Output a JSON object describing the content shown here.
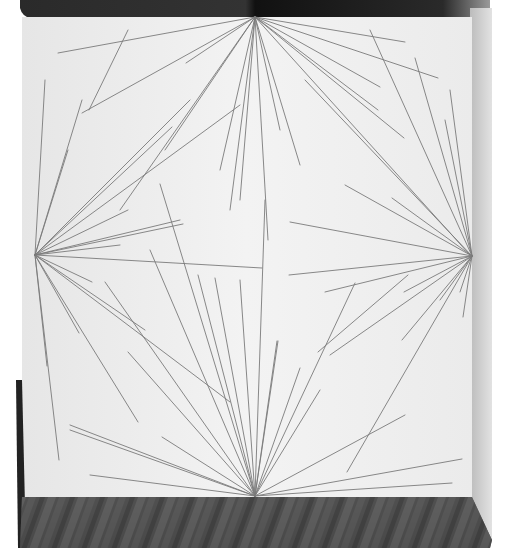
{
  "scene": {
    "description": "Photograph of a wall drawing: straight graphite lines radiating from the midpoints of the four sides of a white wall, above a wooden floor",
    "colors": {
      "background": "#ffffff",
      "wall": "#ececec",
      "wall_light": "#f4f4f4",
      "ceiling": "#1e1e1e",
      "ceiling_right": "#2a2a2a",
      "right_wall": "#d4d4d4",
      "left_edge": "#2b2b2b",
      "floor": "#4a4a4a",
      "floor_dark": "#2e2e2e",
      "line": "#7a7a7a"
    },
    "focal_points": {
      "top": [
        255,
        17
      ],
      "left": [
        35,
        255
      ],
      "right": [
        472,
        256
      ],
      "bottom": [
        255,
        496
      ]
    },
    "lines_from_top": [
      [
        58,
        53
      ],
      [
        82,
        113
      ],
      [
        186,
        63
      ],
      [
        165,
        150
      ],
      [
        120,
        210
      ],
      [
        220,
        170
      ],
      [
        240,
        200
      ],
      [
        230,
        210
      ],
      [
        268,
        240
      ],
      [
        280,
        130
      ],
      [
        300,
        165
      ],
      [
        378,
        110
      ],
      [
        405,
        42
      ],
      [
        438,
        78
      ],
      [
        380,
        87
      ],
      [
        404,
        138
      ],
      [
        470,
        255
      ]
    ],
    "lines_from_left": [
      [
        45,
        80
      ],
      [
        68,
        150
      ],
      [
        82,
        100
      ],
      [
        190,
        100
      ],
      [
        172,
        127
      ],
      [
        240,
        105
      ],
      [
        180,
        220
      ],
      [
        128,
        210
      ],
      [
        183,
        224
      ],
      [
        120,
        245
      ],
      [
        262,
        268
      ],
      [
        92,
        282
      ],
      [
        145,
        330
      ],
      [
        230,
        402
      ],
      [
        138,
        422
      ],
      [
        79,
        333
      ],
      [
        59,
        460
      ],
      [
        47,
        366
      ]
    ],
    "lines_from_right": [
      [
        370,
        30
      ],
      [
        305,
        80
      ],
      [
        415,
        58
      ],
      [
        450,
        90
      ],
      [
        445,
        120
      ],
      [
        345,
        185
      ],
      [
        392,
        198
      ],
      [
        290,
        222
      ],
      [
        289,
        275
      ],
      [
        325,
        292
      ],
      [
        404,
        292
      ],
      [
        330,
        355
      ],
      [
        402,
        340
      ],
      [
        460,
        292
      ],
      [
        440,
        300
      ],
      [
        463,
        317
      ],
      [
        347,
        472
      ]
    ],
    "lines_from_bottom": [
      [
        90,
        475
      ],
      [
        70,
        425
      ],
      [
        70,
        430
      ],
      [
        162,
        437
      ],
      [
        128,
        352
      ],
      [
        105,
        282
      ],
      [
        150,
        250
      ],
      [
        160,
        184
      ],
      [
        198,
        275
      ],
      [
        215,
        278
      ],
      [
        240,
        280
      ],
      [
        265,
        200
      ],
      [
        277,
        341
      ],
      [
        278,
        341
      ],
      [
        300,
        368
      ],
      [
        355,
        283
      ],
      [
        320,
        390
      ],
      [
        405,
        415
      ],
      [
        462,
        459
      ],
      [
        452,
        483
      ]
    ],
    "free_lines": [
      [
        [
          128,
          30
        ],
        [
          89,
          110
        ]
      ],
      [
        [
          318,
          352
        ],
        [
          408,
          275
        ]
      ]
    ]
  }
}
